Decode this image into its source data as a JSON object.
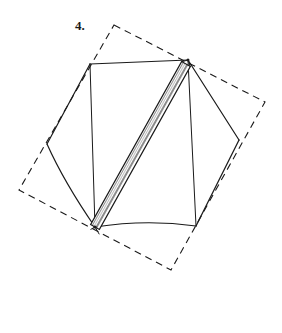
{
  "figure": {
    "label": "4.",
    "caption_text": "4.",
    "background_color": "#ffffff",
    "ink_color": "#1a1a1a",
    "hatch_fill_color": "#ffffff",
    "line_width_solid": 1.1,
    "line_width_dashed": 1.1,
    "dash_pattern": "7,5",
    "width_px": 282,
    "height_px": 333
  },
  "shapes": {
    "dashed_rectangle": {
      "name": "dashed-rotated-rectangle",
      "style": "dashed",
      "points": "114,25 265,102 171,270 19,190",
      "vertices": [
        {
          "x": 114,
          "y": 25
        },
        {
          "x": 265,
          "y": 102
        },
        {
          "x": 171,
          "y": 270
        },
        {
          "x": 19,
          "y": 190
        }
      ]
    },
    "hexagon": {
      "name": "solid-hexagon",
      "style": "solid",
      "vertices": [
        {
          "x": 90,
          "y": 64
        },
        {
          "x": 188,
          "y": 60
        },
        {
          "x": 239,
          "y": 140
        },
        {
          "x": 196,
          "y": 226
        },
        {
          "x": 95,
          "y": 227
        },
        {
          "x": 47,
          "y": 144
        }
      ],
      "curved_edges": [
        {
          "from": {
            "x": 196,
            "y": 226
          },
          "to": {
            "x": 95,
            "y": 227
          },
          "control": {
            "x": 146,
            "y": 219
          }
        },
        {
          "from": {
            "x": 47,
            "y": 144
          },
          "to": {
            "x": 95,
            "y": 227
          },
          "control": {
            "x": 64,
            "y": 182
          }
        }
      ]
    },
    "hatched_strip": {
      "name": "hatched-diagonal-strip",
      "style": "solid-outline-with-hatching",
      "start": {
        "x": 95,
        "y": 227
      },
      "end": {
        "x": 186,
        "y": 64
      },
      "half_width_px": 5.0,
      "hatch_count": 30,
      "description": "narrow elongated band with ladder cross-hatching running between two opposite hexagon vertices"
    },
    "spur_lines": [
      {
        "name": "upper-right-spur",
        "from": {
          "x": 188,
          "y": 60
        },
        "to": {
          "x": 196,
          "y": 226
        }
      },
      {
        "name": "lower-left-spur",
        "from": {
          "x": 95,
          "y": 227
        },
        "to": {
          "x": 90,
          "y": 64
        }
      }
    ]
  }
}
